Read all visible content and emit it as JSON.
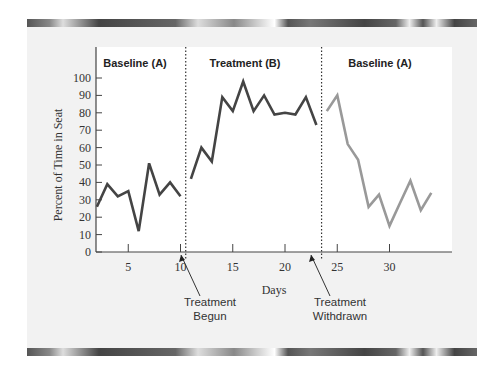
{
  "chart_data": {
    "type": "line",
    "title": "",
    "xlabel": "Days",
    "ylabel": "Percent of Time in Seat",
    "ylim": [
      0,
      100
    ],
    "xlim": [
      1,
      35
    ],
    "grid": false,
    "y_ticks": [
      0,
      10,
      20,
      30,
      40,
      50,
      60,
      70,
      80,
      90,
      100
    ],
    "x_ticks": [
      5,
      10,
      15,
      20,
      25,
      30
    ],
    "phases": [
      {
        "label": "Baseline (A)",
        "start_day": 2,
        "end_day": 10
      },
      {
        "label": "Treatment (B)",
        "start_day": 11,
        "end_day": 23
      },
      {
        "label": "Baseline (A)",
        "start_day": 24,
        "end_day": 34
      }
    ],
    "phase_change_lines": [
      10.5,
      23.5
    ],
    "annotations": [
      {
        "text": [
          "Treatment",
          "Begun"
        ],
        "points_to_day": 10.5
      },
      {
        "text": [
          "Treatment",
          "Withdrawn"
        ],
        "points_to_day": 23.5
      }
    ],
    "series": [
      {
        "name": "Baseline (A)",
        "color": "#444444",
        "x": [
          2,
          3,
          4,
          5,
          6,
          7,
          8,
          9,
          10
        ],
        "values": [
          26,
          39,
          32,
          35,
          12,
          51,
          33,
          40,
          32
        ]
      },
      {
        "name": "Treatment (B)",
        "color": "#444444",
        "x": [
          11,
          12,
          13,
          14,
          15,
          16,
          17,
          18,
          19,
          20,
          21,
          22,
          23
        ],
        "values": [
          42,
          60,
          52,
          89,
          81,
          98,
          81,
          90,
          79,
          80,
          79,
          89,
          73
        ]
      },
      {
        "name": "Baseline (A) return",
        "color": "#999999",
        "x": [
          24,
          25,
          26,
          27,
          28,
          29,
          30,
          31,
          32,
          33,
          34
        ],
        "values": [
          81,
          90,
          62,
          53,
          26,
          33,
          15,
          28,
          41,
          24,
          34
        ]
      }
    ]
  }
}
